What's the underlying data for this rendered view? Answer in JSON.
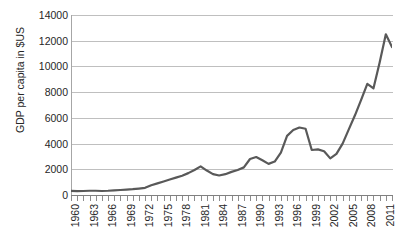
{
  "chart_data": {
    "type": "line",
    "title": "",
    "xlabel": "",
    "ylabel": "GDP per capita in $US",
    "ylim": [
      0,
      14000
    ],
    "ytick_labels": [
      "14000",
      "12000",
      "10000",
      "8000",
      "6000",
      "4000",
      "2000",
      "0"
    ],
    "ytick_values": [
      14000,
      12000,
      10000,
      8000,
      6000,
      4000,
      2000,
      0
    ],
    "xlim": [
      1960,
      2012
    ],
    "xtick_labels": [
      "1960",
      "1963",
      "1966",
      "1969",
      "1972",
      "1975",
      "1978",
      "1981",
      "1984",
      "1987",
      "1990",
      "1993",
      "1996",
      "1999",
      "2002",
      "2005",
      "2008",
      "2011"
    ],
    "xtick_values": [
      1960,
      1963,
      1966,
      1969,
      1972,
      1975,
      1978,
      1981,
      1984,
      1987,
      1990,
      1993,
      1996,
      1999,
      2002,
      2005,
      2008,
      2011
    ],
    "grid": "horizontal",
    "legend": "none",
    "line_color": "#595959",
    "x": [
      1960,
      1961,
      1962,
      1963,
      1964,
      1965,
      1966,
      1967,
      1968,
      1969,
      1970,
      1971,
      1972,
      1973,
      1974,
      1975,
      1976,
      1977,
      1978,
      1979,
      1980,
      1981,
      1982,
      1983,
      1984,
      1985,
      1986,
      1987,
      1988,
      1989,
      1990,
      1991,
      1992,
      1993,
      1994,
      1995,
      1996,
      1997,
      1998,
      1999,
      2000,
      2001,
      2002,
      2003,
      2004,
      2005,
      2006,
      2007,
      2008,
      2009,
      2010,
      2011,
      2012
    ],
    "values": [
      320,
      300,
      310,
      330,
      330,
      310,
      330,
      360,
      390,
      420,
      450,
      500,
      560,
      760,
      900,
      1050,
      1200,
      1350,
      1500,
      1700,
      1950,
      2230,
      1900,
      1620,
      1520,
      1620,
      1800,
      1950,
      2150,
      2800,
      2950,
      2700,
      2420,
      2600,
      3300,
      4600,
      5050,
      5250,
      5150,
      3500,
      3550,
      3400,
      2850,
      3200,
      4000,
      5100,
      6200,
      7400,
      8650,
      8300,
      10300,
      12500,
      11500
    ],
    "series": [
      {
        "name": "GDP per capita",
        "values": [
          320,
          300,
          310,
          330,
          330,
          310,
          330,
          360,
          390,
          420,
          450,
          500,
          560,
          760,
          900,
          1050,
          1200,
          1350,
          1500,
          1700,
          1950,
          2230,
          1900,
          1620,
          1520,
          1620,
          1800,
          1950,
          2150,
          2800,
          2950,
          2700,
          2420,
          2600,
          3300,
          4600,
          5050,
          5250,
          5150,
          3500,
          3550,
          3400,
          2850,
          3200,
          4000,
          5100,
          6200,
          7400,
          8650,
          8300,
          10300,
          12500,
          11500
        ]
      }
    ]
  }
}
